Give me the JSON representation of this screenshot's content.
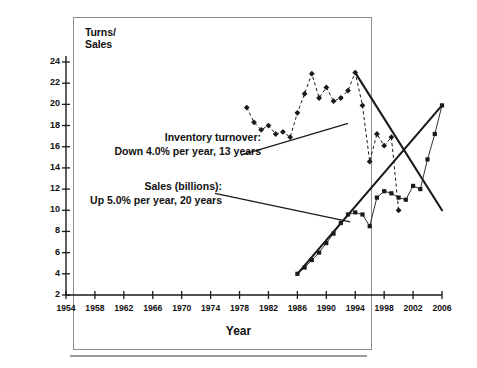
{
  "chart_data": {
    "type": "line",
    "title": "",
    "xlabel": "Year",
    "ylabel": "Turns/ Sales",
    "ylabel_lines": [
      "Turns/",
      "Sales"
    ],
    "xlim": [
      1954,
      2006
    ],
    "ylim": [
      2,
      24
    ],
    "ytick_step": 2,
    "xtick_step": 4,
    "grid": false,
    "legend": "none",
    "yticks": [
      24,
      22,
      20,
      18,
      16,
      14,
      12,
      10,
      8,
      6,
      4,
      2
    ],
    "xticks": [
      1954,
      1958,
      1962,
      1966,
      1970,
      1974,
      1978,
      1982,
      1986,
      1990,
      1994,
      1998,
      2002,
      2006
    ],
    "series": [
      {
        "name": "Inventory turnover",
        "marker": "diamond",
        "linestyle": "dashed",
        "color": "#1a1a1a",
        "x": [
          1979,
          1980,
          1981,
          1982,
          1983,
          1984,
          1985,
          1986,
          1987,
          1988,
          1989,
          1990,
          1991,
          1992,
          1993,
          1994,
          1995,
          1996,
          1997,
          1998,
          1999,
          2000
        ],
        "values": [
          19.7,
          18.3,
          17.6,
          18.0,
          17.2,
          17.4,
          16.9,
          19.2,
          21.0,
          22.9,
          20.6,
          21.6,
          20.3,
          20.6,
          21.3,
          23.0,
          19.9,
          14.6,
          17.2,
          16.1,
          16.9,
          10.0
        ]
      },
      {
        "name": "Sales (billions)",
        "marker": "square",
        "linestyle": "solid",
        "color": "#1a1a1a",
        "x": [
          1986,
          1987,
          1988,
          1989,
          1990,
          1991,
          1992,
          1993,
          1994,
          1995,
          1996,
          1997,
          1998,
          1999,
          2000,
          2001,
          2002,
          2003,
          2004,
          2005,
          2006
        ],
        "values": [
          4.0,
          4.6,
          5.3,
          6.0,
          6.9,
          7.8,
          8.8,
          9.6,
          9.8,
          9.6,
          8.5,
          11.2,
          11.8,
          11.6,
          11.2,
          11.0,
          12.3,
          12.0,
          14.8,
          17.2,
          19.9
        ]
      }
    ],
    "trendlines": [
      {
        "name": "sales-trend-up",
        "description": "Up 5.0% per year, 20 years",
        "x": [
          1986,
          2006
        ],
        "values": [
          4.0,
          19.9
        ]
      },
      {
        "name": "turnover-trend-down",
        "description": "Down 4.0% per year, 13 years",
        "x": [
          1994,
          2006
        ],
        "values": [
          23.0,
          10.0
        ]
      }
    ],
    "annotations": [
      {
        "id": "inventory-turnover",
        "line1": "Inventory turnover:",
        "line2": "Down 4.0% per year, 13 years",
        "leader_from": [
          1978.2,
          15.2
        ],
        "leader_to": [
          1993.0,
          18.2
        ]
      },
      {
        "id": "sales-billions",
        "line1": "Sales (billions):",
        "line2": "Up 5.0% per year, 20 years",
        "leader_from": [
          1974.6,
          11.6
        ],
        "leader_to": [
          1993.3,
          8.9
        ]
      }
    ]
  },
  "colors": {
    "ink": "#1a1a1a",
    "frame": "#8d8d8d",
    "rule": "#9a9a9a",
    "background": "#ffffff"
  }
}
